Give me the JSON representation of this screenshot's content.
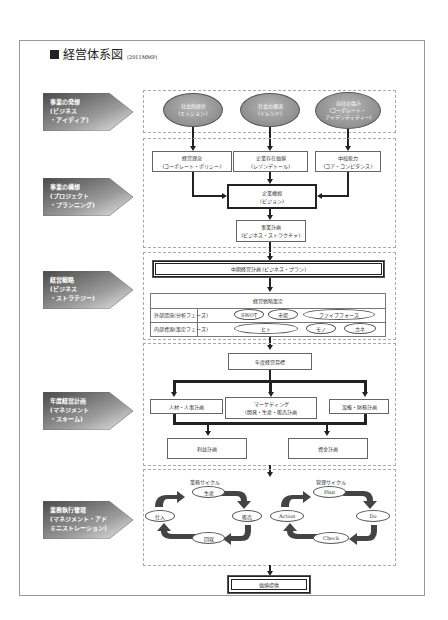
{
  "title": {
    "main": "経営体系図",
    "sub": "(2011MMP)"
  },
  "tabs": [
    {
      "lines": "事業の発想\n(ビジネス\n・アイディア)"
    },
    {
      "lines": "事業の構想\n(プロジェクト\n・プランニング)"
    },
    {
      "lines": "経営戦略\n(ビジネス\n・ストラテジー)"
    },
    {
      "lines": "年度経営計画\n(マネジメント\n・スキーム)"
    },
    {
      "lines": "業務執行管理\n(マネジメント・アド\nミニストレーション)"
    }
  ],
  "section1": {
    "ellipses": [
      {
        "l1": "社会的使命",
        "l2": "(ミッション)",
        "l3": ""
      },
      {
        "l1": "社会の潮流",
        "l2": "(トレンド)",
        "l3": ""
      },
      {
        "l1": "自社の強み",
        "l2": "(コーポレート・",
        "l3": "アイデンティティー)"
      }
    ]
  },
  "section2": {
    "boxes": [
      {
        "l1": "経営理念",
        "l2": "(コーポレート・ポリシー)"
      },
      {
        "l1": "企業存在価値",
        "l2": "(レゾンデトール)"
      },
      {
        "l1": "中核能力",
        "l2": "(コア・コンピタンス)"
      }
    ],
    "vision": {
      "l1": "企業構想",
      "l2": "(ビジョン)"
    },
    "plan": {
      "l1": "事業計画",
      "l2": "(ビジネス・ストラクチャ)"
    }
  },
  "section3": {
    "midplan": "中期経営計画 (ビジネス・プラン)",
    "strategy_title": "経営戦略策定",
    "rows": [
      {
        "label": "外部環境(分析フェーズ)",
        "items": [
          "SWOT",
          "市場",
          "ファイブフォース"
        ]
      },
      {
        "label": "内部資源(策定フェーズ)",
        "items": [
          "ヒト",
          "モノ",
          "カネ"
        ]
      }
    ]
  },
  "section4": {
    "goal": "年度経営目標",
    "plans": [
      {
        "l1": "人材・人事計画",
        "l2": ""
      },
      {
        "l1": "マーケティング",
        "l2": "(開発・生産・販売計画"
      },
      {
        "l1": "設備・財務計画",
        "l2": ""
      }
    ],
    "profit": "利益計画",
    "fund": "資金計画"
  },
  "section5": {
    "business_cycle": {
      "title": "業務サイクル",
      "nodes": [
        "生産",
        "販売",
        "回収",
        "仕入"
      ]
    },
    "management_cycle": {
      "title": "管理サイクル",
      "nodes": [
        "Plan",
        "Do",
        "Check",
        "Action"
      ]
    }
  },
  "value": "価値提供",
  "colors": {
    "tab_dark": "#555555",
    "tab_light": "#e0e0e0",
    "ellipse": "#999999"
  }
}
